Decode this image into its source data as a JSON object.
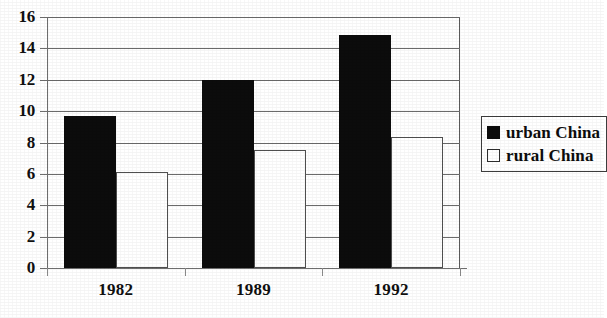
{
  "chart_data": {
    "type": "bar",
    "title": "",
    "subtitle": "",
    "xlabel": "",
    "ylabel": "",
    "categories": [
      "1982",
      "1989",
      "1992"
    ],
    "series": [
      {
        "name": "urban China",
        "values": [
          9.7,
          12.0,
          14.85
        ],
        "color": "#0c0c0c",
        "fill": "solid"
      },
      {
        "name": "rural China",
        "values": [
          6.1,
          7.5,
          8.35
        ],
        "color": "#ffffff",
        "fill": "hollow"
      }
    ],
    "ylim": [
      0,
      16
    ],
    "ytick_step": 2,
    "yticks": [
      "0",
      "2",
      "4",
      "6",
      "8",
      "10",
      "12",
      "14",
      "16"
    ],
    "grid": true,
    "grid_axis": "y",
    "legend_position": "right",
    "legend_entries": [
      "urban China",
      "rural China"
    ]
  },
  "axes": {
    "y_tick_labels": [
      "16",
      "14",
      "12",
      "10",
      "8",
      "6",
      "4",
      "2",
      "0"
    ],
    "x_tick_labels": [
      "1982",
      "1989",
      "1992"
    ]
  },
  "legend": {
    "items": [
      {
        "label": "urban China",
        "swatch": "filled-black-square"
      },
      {
        "label": "rural China",
        "swatch": "hollow-white-square"
      }
    ]
  },
  "colors": {
    "urban": "#0c0c0c",
    "rural": "#ffffff",
    "grid": "#6b6b6b",
    "axis": "#6e6e6e",
    "text": "#101010",
    "background": "#ffffff"
  }
}
